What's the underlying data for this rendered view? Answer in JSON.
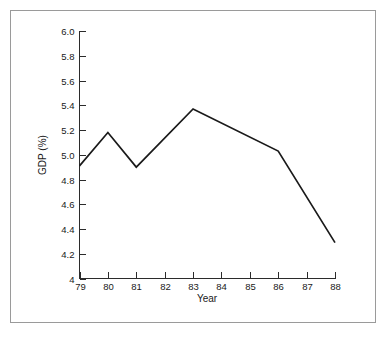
{
  "chart_data": {
    "type": "line",
    "title": "",
    "xlabel": "Year",
    "ylabel": "GDP (%)",
    "x": [
      79,
      80,
      81,
      82,
      83,
      84,
      85,
      86,
      87,
      88
    ],
    "x_tick_labels": [
      "79",
      "80",
      "81",
      "82",
      "83",
      "84",
      "85",
      "86",
      "87",
      "88"
    ],
    "y_tick_labels": [
      "4",
      "4.2",
      "4.4",
      "4.6",
      "4.8",
      "5.0",
      "5.2",
      "5.4",
      "5.6",
      "5.8",
      "6.0"
    ],
    "y_tick_values": [
      4.0,
      4.2,
      4.4,
      4.6,
      4.8,
      5.0,
      5.2,
      5.4,
      5.6,
      5.8,
      6.0
    ],
    "xlim": [
      79,
      88
    ],
    "ylim": [
      4.0,
      6.0
    ],
    "grid": false,
    "legend": null,
    "series": [
      {
        "name": "GDP (%)",
        "color": "#1a1a1a",
        "values": [
          4.91,
          5.18,
          4.9,
          5.06,
          5.37,
          5.26,
          5.15,
          5.03,
          4.66,
          4.29
        ],
        "vertices": [
          {
            "x": 79,
            "y": 4.91
          },
          {
            "x": 80,
            "y": 5.18
          },
          {
            "x": 81,
            "y": 4.9
          },
          {
            "x": 83,
            "y": 5.37
          },
          {
            "x": 86,
            "y": 5.03
          },
          {
            "x": 88,
            "y": 4.29
          }
        ]
      }
    ]
  },
  "figure": {
    "border_color": "#9a9a9a",
    "background_color": "#ffffff",
    "axis_color": "#2b2b2b"
  }
}
